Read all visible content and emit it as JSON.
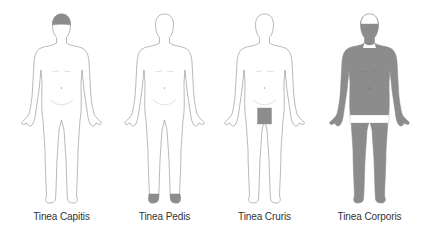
{
  "figures": [
    {
      "label": "Tinea Capitis",
      "affected_region": "scalp",
      "center_x": 62
    },
    {
      "label": "Tinea Pedis",
      "affected_region": "feet",
      "center_x": 165
    },
    {
      "label": "Tinea Cruris",
      "affected_region": "groin",
      "center_x": 265
    },
    {
      "label": "Tinea Corporis",
      "affected_region": "body (trunk, arms, legs, back of head)",
      "center_x": 370
    }
  ],
  "colors": {
    "outline": "#8a8a8a",
    "affected_fill": "#8c8c8c",
    "body_fill": "#ffffff",
    "label_text": "#333333"
  }
}
